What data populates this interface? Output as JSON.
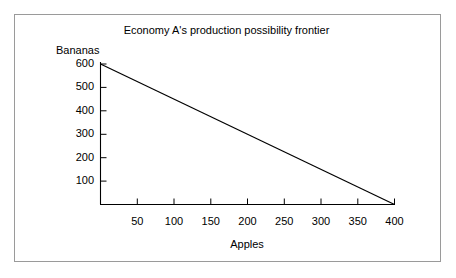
{
  "figure": {
    "background_color": "#ffffff",
    "border_color": "#9a9a9a",
    "line_color": "#000000"
  },
  "chart_data": {
    "type": "line",
    "title": "Economy A's production possibility frontier",
    "xlabel": "Apples",
    "ylabel": "Bananas",
    "xlim": [
      0,
      400
    ],
    "ylim": [
      0,
      600
    ],
    "grid": false,
    "legend": false,
    "x_ticks": [
      50,
      100,
      150,
      200,
      250,
      300,
      350,
      400
    ],
    "x_tick_labels": [
      "50",
      "100",
      "150",
      "200",
      "250",
      "300",
      "350",
      "400"
    ],
    "y_ticks": [
      100,
      200,
      300,
      400,
      500,
      600
    ],
    "y_tick_labels": [
      "100",
      "200",
      "300",
      "400",
      "500",
      "600"
    ],
    "series": [
      {
        "name": "production possibility frontier",
        "x": [
          0,
          400
        ],
        "y": [
          600,
          0
        ],
        "color": "#000000",
        "style": "solid"
      }
    ],
    "annotations": []
  }
}
